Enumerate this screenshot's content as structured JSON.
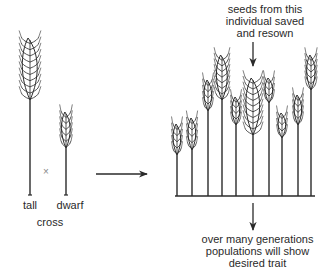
{
  "labels": {
    "top_line1": "seeds from this",
    "top_line2": "individual saved",
    "top_line3": "and resown",
    "bottom_line1": "over many generations",
    "bottom_line2": "populations will show",
    "bottom_line3": "desired trait",
    "tall": "tall",
    "dwarf": "dwarf",
    "cross": "cross",
    "cross_symbol": "×"
  },
  "colors": {
    "ink": "#2a2a2a",
    "background": "#ffffff"
  },
  "parents": [
    {
      "name": "tall",
      "x": 30,
      "head_top": 38,
      "head_bottom": 100,
      "base": 195
    },
    {
      "name": "dwarf",
      "x": 66,
      "head_top": 112,
      "head_bottom": 148,
      "base": 195
    }
  ],
  "offspring": [
    {
      "x": 177,
      "head_top": 124,
      "head_bottom": 155
    },
    {
      "x": 192,
      "head_top": 118,
      "head_bottom": 150
    },
    {
      "x": 208,
      "head_top": 80,
      "head_bottom": 111
    },
    {
      "x": 222,
      "head_top": 55,
      "head_bottom": 100
    },
    {
      "x": 236,
      "head_top": 97,
      "head_bottom": 125
    },
    {
      "x": 253,
      "head_top": 78,
      "head_bottom": 135
    },
    {
      "x": 269,
      "head_top": 78,
      "head_bottom": 103
    },
    {
      "x": 282,
      "head_top": 113,
      "head_bottom": 138
    },
    {
      "x": 298,
      "head_top": 95,
      "head_bottom": 125
    },
    {
      "x": 311,
      "head_top": 55,
      "head_bottom": 90
    }
  ]
}
